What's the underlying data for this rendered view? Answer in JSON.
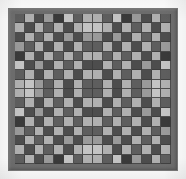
{
  "figure": {
    "canvas": {
      "width": 186,
      "height": 179,
      "background": "#ffffff"
    },
    "frame": {
      "name": "panel-frame",
      "color": "#6e6e6e",
      "x": 8,
      "y": 8,
      "width": 170,
      "height": 163,
      "thickness": 7
    },
    "grid": {
      "rows": 16,
      "columns": 16,
      "x": 15,
      "y": 14,
      "width": 156,
      "height": 150,
      "cell_width": 9.75,
      "cell_height": 9.375,
      "grout_color": "#3c3c3c"
    }
  },
  "palette": {
    "level_0": "#3a3a3a",
    "level_1": "#4d4d4d",
    "level_2": "#5e5e5e",
    "level_3": "#707070",
    "level_4": "#858585",
    "level_5": "#9a9a9a",
    "level_6": "#b0b0b0",
    "level_7": "#c4c4c4"
  },
  "chart_data": {
    "type": "heatmap",
    "xlabel": "",
    "ylabel": "",
    "rows": 16,
    "columns": 16,
    "value_range": [
      0,
      7
    ],
    "colorscale": [
      "#3a3a3a",
      "#4d4d4d",
      "#5e5e5e",
      "#707070",
      "#858585",
      "#9a9a9a",
      "#b0b0b0",
      "#c4c4c4"
    ],
    "grid_lines": true,
    "legend": "none",
    "values": [
      [
        2,
        6,
        1,
        5,
        0,
        7,
        2,
        6,
        6,
        2,
        7,
        0,
        5,
        1,
        6,
        2
      ],
      [
        6,
        1,
        6,
        2,
        6,
        1,
        6,
        7,
        7,
        6,
        1,
        6,
        2,
        6,
        1,
        6
      ],
      [
        1,
        6,
        2,
        6,
        1,
        5,
        1,
        5,
        5,
        1,
        5,
        1,
        6,
        2,
        6,
        1
      ],
      [
        5,
        2,
        6,
        1,
        6,
        1,
        6,
        2,
        2,
        6,
        1,
        6,
        1,
        6,
        2,
        5
      ],
      [
        0,
        6,
        1,
        6,
        2,
        6,
        2,
        6,
        6,
        2,
        6,
        2,
        6,
        1,
        6,
        0
      ],
      [
        7,
        1,
        5,
        1,
        6,
        2,
        6,
        1,
        1,
        6,
        2,
        6,
        1,
        5,
        1,
        7
      ],
      [
        2,
        6,
        1,
        6,
        2,
        6,
        1,
        6,
        6,
        1,
        6,
        2,
        6,
        1,
        6,
        2
      ],
      [
        6,
        7,
        5,
        2,
        6,
        1,
        6,
        2,
        2,
        6,
        1,
        6,
        2,
        5,
        7,
        6
      ],
      [
        6,
        7,
        5,
        2,
        6,
        1,
        6,
        2,
        2,
        6,
        1,
        6,
        2,
        5,
        7,
        6
      ],
      [
        2,
        6,
        1,
        6,
        2,
        6,
        1,
        6,
        6,
        1,
        6,
        2,
        6,
        1,
        6,
        2
      ],
      [
        7,
        1,
        5,
        1,
        6,
        2,
        6,
        1,
        1,
        6,
        2,
        6,
        1,
        5,
        1,
        7
      ],
      [
        0,
        6,
        1,
        6,
        2,
        6,
        2,
        6,
        6,
        2,
        6,
        2,
        6,
        1,
        6,
        0
      ],
      [
        5,
        2,
        6,
        1,
        6,
        1,
        6,
        2,
        2,
        6,
        1,
        6,
        1,
        6,
        2,
        5
      ],
      [
        1,
        6,
        2,
        6,
        1,
        5,
        1,
        5,
        5,
        1,
        5,
        1,
        6,
        2,
        6,
        1
      ],
      [
        6,
        1,
        6,
        2,
        6,
        1,
        6,
        7,
        7,
        6,
        1,
        6,
        2,
        6,
        1,
        6
      ],
      [
        2,
        6,
        1,
        5,
        0,
        7,
        2,
        6,
        6,
        2,
        7,
        0,
        5,
        1,
        6,
        2
      ]
    ]
  }
}
